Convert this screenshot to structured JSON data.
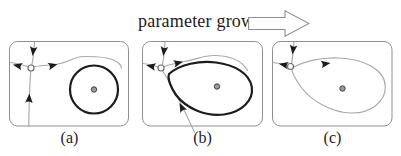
{
  "figure": {
    "caption": "parameter grows",
    "panels": [
      {
        "label": "(a)"
      },
      {
        "label": "(b)"
      },
      {
        "label": "(c)"
      }
    ]
  },
  "colors": {
    "background": "#ffffff",
    "ink": "#1c1c1c",
    "trajectory_gray": "#a9a9a9",
    "border_gray": "#8f8f8f",
    "focus_fill": "#9b9b9b",
    "focus_stroke": "#404040",
    "saddle_fill": "#ffffff",
    "saddle_stroke": "#6e6e6e"
  }
}
